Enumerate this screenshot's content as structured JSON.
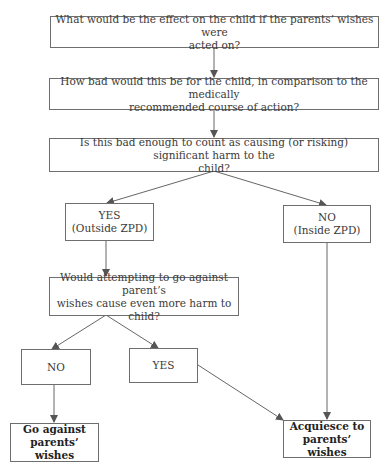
{
  "nodes": {
    "q1": {
      "lines": [
        "What would be the effect on the child if the parents’ wishes were",
        "acted on?"
      ]
    },
    "q2": {
      "lines": [
        "How bad would this be for the child, in comparison to the medically",
        "recommended course of action?"
      ]
    },
    "q3": {
      "lines": [
        "Is this bad enough to count as causing (or risking) significant harm to the",
        "child?"
      ]
    },
    "yes_outside": {
      "lines": [
        "YES",
        "(Outside ZPD)"
      ]
    },
    "no_inside": {
      "lines": [
        "NO",
        "(Inside ZPD)"
      ]
    },
    "q4": {
      "lines": [
        "Would attempting to go against parent’s",
        "wishes cause even more harm to child?"
      ]
    },
    "no2": {
      "lines": [
        "NO"
      ]
    },
    "yes2": {
      "lines": [
        "YES"
      ]
    },
    "go_against": {
      "lines": [
        "Go against",
        "parents’ wishes"
      ]
    },
    "acquiesce": {
      "lines": [
        "Acquiesce to",
        "parents’ wishes"
      ]
    }
  },
  "colors": {
    "line": "#666666",
    "border": "#6e6e6e",
    "text": "#3a3a3a"
  }
}
